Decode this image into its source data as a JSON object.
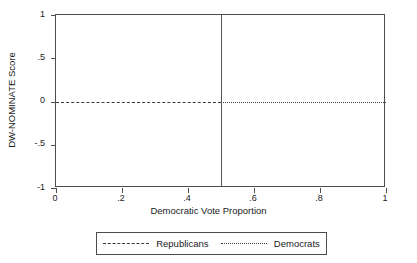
{
  "chart_data": {
    "type": "line",
    "title": "",
    "xlabel": "Democratic Vote Proportion",
    "ylabel": "DW-NOMINATE Score",
    "xlim": [
      0,
      1
    ],
    "ylim": [
      -1,
      1
    ],
    "grid": false,
    "legend_position": "below",
    "x_ticks": [
      {
        "value": 0,
        "label": "0"
      },
      {
        "value": 0.2,
        "label": ".2"
      },
      {
        "value": 0.4,
        "label": ".4"
      },
      {
        "value": 0.6,
        "label": ".6"
      },
      {
        "value": 0.8,
        "label": ".8"
      },
      {
        "value": 1,
        "label": "1"
      }
    ],
    "y_ticks": [
      {
        "value": 1,
        "label": "1"
      },
      {
        "value": 0.5,
        "label": ".5"
      },
      {
        "value": 0,
        "label": "0"
      },
      {
        "value": -0.5,
        "label": "-.5"
      },
      {
        "value": -1,
        "label": "-1"
      }
    ],
    "series": [
      {
        "name": "Republicans",
        "style": "dashed",
        "color": "#3a3a3a",
        "x": [
          0,
          0.5
        ],
        "values": [
          0,
          0
        ]
      },
      {
        "name": "Democrats",
        "style": "dotted",
        "color": "#3a3a3a",
        "x": [
          0.5,
          1
        ],
        "values": [
          0,
          0
        ]
      }
    ],
    "annotations": [
      {
        "type": "vertical-line",
        "x": 0.5,
        "style": "solid",
        "color": "#555555"
      }
    ]
  },
  "legend": {
    "entries": [
      {
        "label": "Republicans",
        "style": "dashed"
      },
      {
        "label": "Democrats",
        "style": "dotted"
      }
    ]
  }
}
